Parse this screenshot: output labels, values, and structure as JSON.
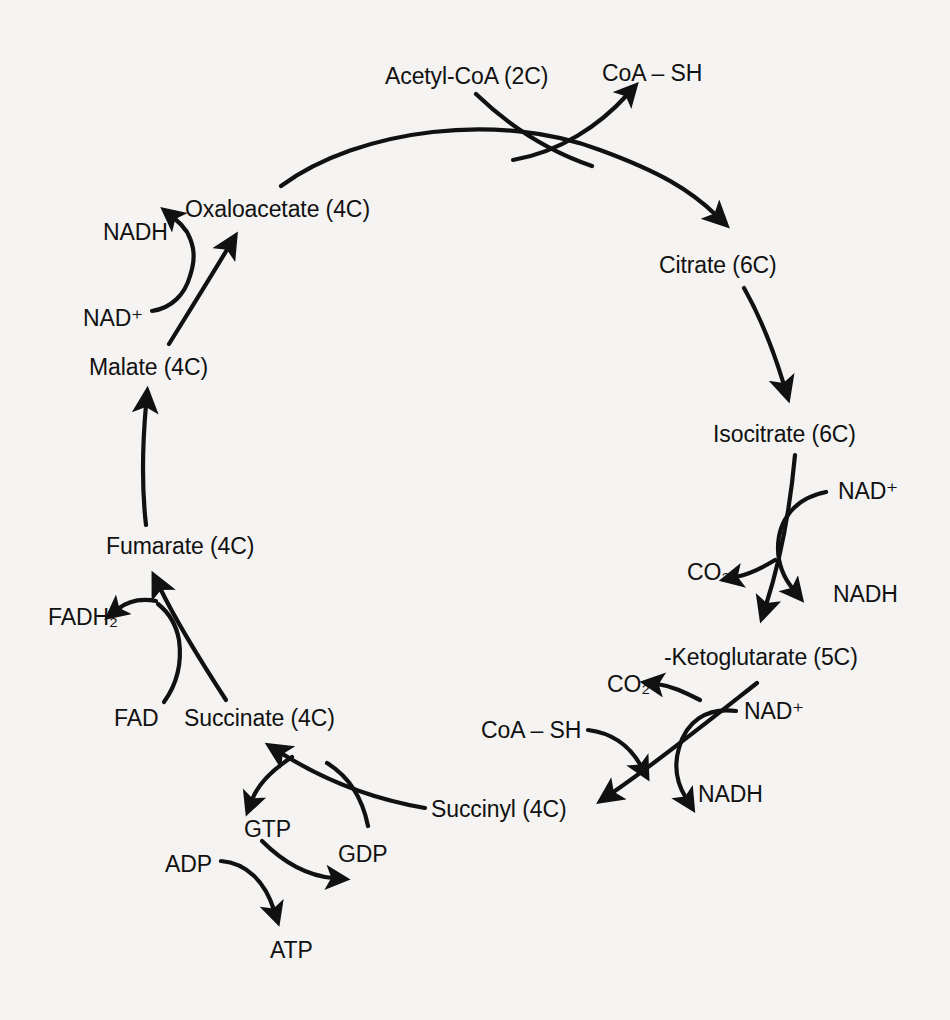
{
  "diagram": {
    "type": "cycle-flow-diagram",
    "background_color": "#f5f4f2",
    "ink_color": "#111111",
    "metabolites": [
      {
        "id": "oxaloacetate",
        "label": "Oxaloacetate (4C)",
        "carbons": 4,
        "x": 185,
        "y": 198
      },
      {
        "id": "citrate",
        "label": "Citrate (6C)",
        "carbons": 6,
        "x": 659,
        "y": 254
      },
      {
        "id": "isocitrate",
        "label": "Isocitrate (6C)",
        "carbons": 6,
        "x": 713,
        "y": 423
      },
      {
        "id": "ketoglutarate",
        "label": "-Ketoglutarate (5C)",
        "carbons": 5,
        "x": 664,
        "y": 646
      },
      {
        "id": "succinyl",
        "label": "Succinyl (4C)",
        "carbons": 4,
        "x": 431,
        "y": 798
      },
      {
        "id": "succinate",
        "label": "Succinate (4C)",
        "carbons": 4,
        "x": 184,
        "y": 707
      },
      {
        "id": "fumarate",
        "label": "Fumarate (4C)",
        "carbons": 4,
        "x": 106,
        "y": 535
      },
      {
        "id": "malate",
        "label": "Malate (4C)",
        "carbons": 4,
        "x": 89,
        "y": 356
      }
    ],
    "cofactors": [
      {
        "id": "acetyl-coa",
        "label": "Acetyl-CoA (2C)",
        "x": 385,
        "y": 65
      },
      {
        "id": "coa-sh-top",
        "label": "CoA – SH",
        "x": 602,
        "y": 62
      },
      {
        "id": "nadh-malate",
        "label": "NADH",
        "x": 103,
        "y": 221
      },
      {
        "id": "nadplus-malate",
        "label": "NAD⁺",
        "x": 83,
        "y": 307
      },
      {
        "id": "nadplus-isocitrate",
        "label": "NAD⁺",
        "x": 838,
        "y": 480
      },
      {
        "id": "co2-isocitrate",
        "label": "CO₂",
        "x": 687,
        "y": 561
      },
      {
        "id": "nadh-isocitrate",
        "label": "NADH",
        "x": 833,
        "y": 583
      },
      {
        "id": "co2-ketoglutarate",
        "label": "CO₂",
        "x": 607,
        "y": 673
      },
      {
        "id": "nadplus-ketoglutarate",
        "label": "NAD⁺",
        "x": 744,
        "y": 700
      },
      {
        "id": "coa-sh-ketoglutarate",
        "label": "CoA – SH",
        "x": 481,
        "y": 719
      },
      {
        "id": "nadh-ketoglutarate",
        "label": "NADH",
        "x": 698,
        "y": 783
      },
      {
        "id": "gtp",
        "label": "GTP",
        "x": 244,
        "y": 818
      },
      {
        "id": "gdp",
        "label": "GDP",
        "x": 338,
        "y": 843
      },
      {
        "id": "adp",
        "label": "ADP",
        "x": 165,
        "y": 853
      },
      {
        "id": "atp",
        "label": "ATP",
        "x": 270,
        "y": 939
      },
      {
        "id": "fadh2",
        "label": "FADH₂",
        "x": 48,
        "y": 606
      },
      {
        "id": "fad",
        "label": "FAD",
        "x": 114,
        "y": 707
      }
    ],
    "reactions": [
      {
        "from": "oxaloacetate",
        "to": "citrate",
        "adds": "acetyl-coa",
        "releases": "coa-sh-top"
      },
      {
        "from": "citrate",
        "to": "isocitrate"
      },
      {
        "from": "isocitrate",
        "to": "ketoglutarate",
        "uses": "NAD+",
        "releases": [
          "CO2",
          "NADH"
        ]
      },
      {
        "from": "ketoglutarate",
        "to": "succinyl",
        "uses": [
          "NAD+",
          "CoA-SH"
        ],
        "releases": [
          "CO2",
          "NADH"
        ]
      },
      {
        "from": "succinyl",
        "to": "succinate",
        "uses": "GDP",
        "releases": "GTP"
      },
      {
        "from": "gtp",
        "to": "gdp",
        "uses": "ADP",
        "releases": "ATP"
      },
      {
        "from": "succinate",
        "to": "fumarate",
        "uses": "FAD",
        "releases": "FADH2"
      },
      {
        "from": "fumarate",
        "to": "malate"
      },
      {
        "from": "malate",
        "to": "oxaloacetate",
        "uses": "NAD+",
        "releases": "NADH"
      }
    ]
  }
}
